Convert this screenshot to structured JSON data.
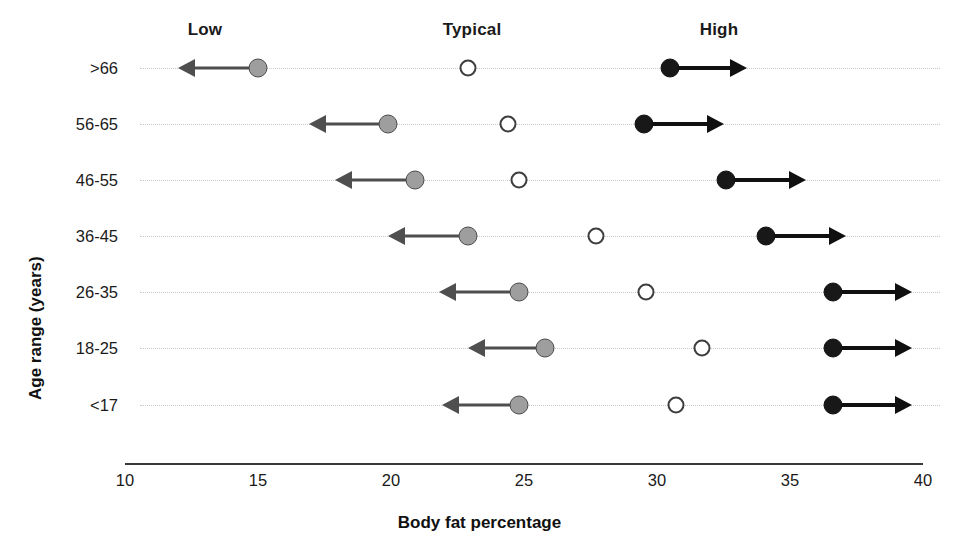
{
  "chart_data": {
    "type": "scatter",
    "title": "",
    "xlabel": "Body fat percentage",
    "ylabel": "Age range (years)",
    "xlim": [
      10,
      40
    ],
    "xticks": [
      10,
      15,
      20,
      25,
      30,
      35,
      40
    ],
    "xtick_labels": [
      "10",
      "15",
      "20",
      "25",
      "30",
      "35",
      "40"
    ],
    "grid": "dotted horizontal guides per category",
    "legend_position": "top (column headers)",
    "column_headers": [
      "Low",
      "Typical",
      "High"
    ],
    "categories": [
      "&gt;66",
      "56-65",
      "46-55",
      "36-45",
      "26-35",
      "18-25",
      "&lt;17"
    ],
    "series": [
      {
        "name": "Low",
        "marker": "filled-gray-circle",
        "color": "#9e9e9e",
        "arrow": "left",
        "values": [
          15.0,
          19.9,
          20.9,
          22.9,
          24.8,
          25.8,
          24.8
        ],
        "arrow_tips": [
          12.0,
          16.9,
          17.9,
          19.9,
          21.8,
          22.9,
          21.9
        ]
      },
      {
        "name": "Typical",
        "marker": "open-circle",
        "color": "#ffffff",
        "arrow": "none",
        "values": [
          22.9,
          24.4,
          24.8,
          27.7,
          29.6,
          31.7,
          30.7
        ],
        "arrow_tips": [
          null,
          null,
          null,
          null,
          null,
          null,
          null
        ]
      },
      {
        "name": "High",
        "marker": "filled-black-circle",
        "color": "#181818",
        "arrow": "right",
        "values": [
          30.5,
          29.5,
          32.6,
          34.1,
          36.6,
          36.6,
          36.6
        ],
        "arrow_tips": [
          33.4,
          32.5,
          35.6,
          37.1,
          39.6,
          39.6,
          39.6
        ]
      }
    ]
  },
  "axis": {
    "x_title": "Body fat percentage",
    "y_title": "Age range (years)"
  },
  "headers": {
    "low": "Low",
    "typical": "Typical",
    "high": "High"
  },
  "colors": {
    "low_marker": "#9e9e9e",
    "typical_marker": "#ffffff",
    "high_marker": "#181818",
    "guide": "#c9c9c9",
    "axis": "#3a3a3a"
  }
}
